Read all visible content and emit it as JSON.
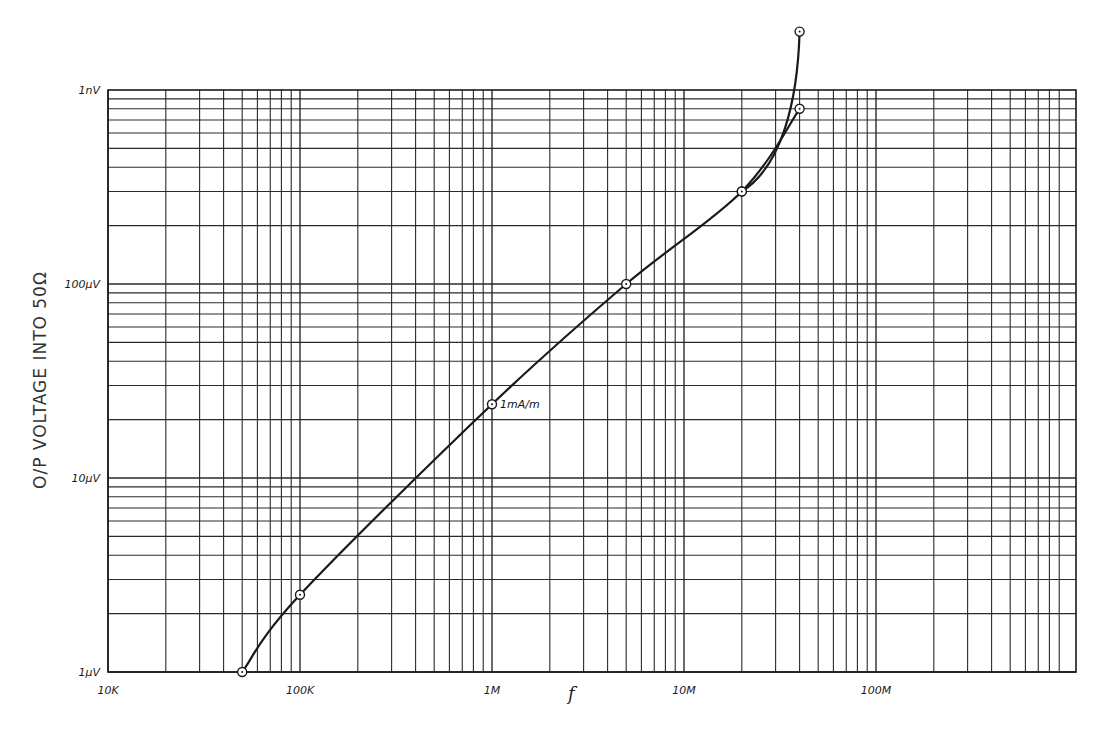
{
  "chart_data": {
    "type": "line",
    "title": "",
    "xlabel": "f",
    "ylabel": "O/P VOLTAGE INTO 50Ω",
    "xscale": "log",
    "yscale": "log",
    "xlim": [
      10000,
      1000000000
    ],
    "ylim": [
      1e-06,
      0.001
    ],
    "grid": true,
    "x_tick_labels": [
      "10K",
      "100K",
      "1M",
      "10M",
      "100M"
    ],
    "y_tick_labels": [
      "1µV",
      "10µV",
      "100µV",
      "1nV"
    ],
    "annotations": [
      {
        "text": "1mA/m",
        "x": 1000000,
        "y": 2.4e-05
      }
    ],
    "series": [
      {
        "name": "main",
        "x": [
          50000,
          100000,
          1000000,
          5000000,
          20000000,
          40000000
        ],
        "y": [
          1e-06,
          2.5e-06,
          2.4e-05,
          0.0001,
          0.0003,
          0.0008
        ],
        "markers": "open-circle"
      },
      {
        "name": "upper-branch",
        "x": [
          20000000,
          40000000
        ],
        "y": [
          0.0003,
          0.002
        ],
        "markers": "open-circle"
      }
    ]
  },
  "labels": {
    "y_ticks": [
      {
        "text": "1nV",
        "value": 0.001
      },
      {
        "text": "100µV",
        "value": 0.0001
      },
      {
        "text": "10µV",
        "value": 1e-05
      },
      {
        "text": "1µV",
        "value": 1e-06
      }
    ],
    "x_ticks": [
      {
        "text": "10K",
        "value": 10000
      },
      {
        "text": "100K",
        "value": 100000
      },
      {
        "text": "1M",
        "value": 1000000
      },
      {
        "text": "10M",
        "value": 10000000
      },
      {
        "text": "100M",
        "value": 100000000
      }
    ],
    "x_title": "f",
    "y_title": "O/P VOLTAGE INTO 50Ω",
    "annotation": "1mA/m"
  },
  "colors": {
    "ink": "#1a1a1a",
    "grid": "#2a2a2a",
    "background": "#ffffff"
  }
}
